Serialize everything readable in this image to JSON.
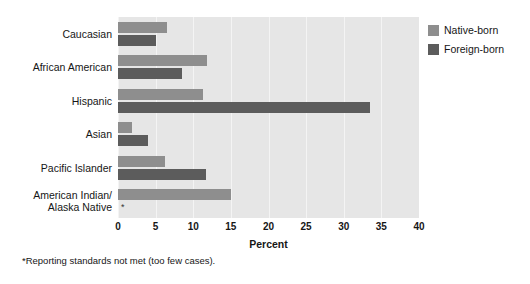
{
  "chart_data": {
    "type": "bar",
    "orientation": "horizontal",
    "title": "",
    "xlabel": "Percent",
    "ylabel": "",
    "xlim": [
      0,
      40
    ],
    "xticks": [
      0,
      5,
      10,
      15,
      20,
      25,
      30,
      35,
      40
    ],
    "grid": true,
    "legend_position": "top-right",
    "categories": [
      "Caucasian",
      "African American",
      "Hispanic",
      "Asian",
      "Pacific Islander",
      "American Indian/\nAlaska Native"
    ],
    "series": [
      {
        "name": "Native-born",
        "color": "#8e8e8e",
        "values": [
          6.5,
          11.8,
          11.3,
          1.8,
          6.3,
          15.0
        ]
      },
      {
        "name": "Foreign-born",
        "color": "#5c5c5c",
        "values": [
          5.0,
          8.5,
          33.5,
          4.0,
          11.7,
          null
        ]
      }
    ],
    "annotations": [
      {
        "text": "*",
        "category": "American Indian/\nAlaska Native",
        "series": "Foreign-born",
        "meaning": "Reporting standards not met (too few cases)."
      }
    ],
    "footnote": "*Reporting standards not met (too few cases)."
  },
  "legend": {
    "items": [
      {
        "label": "Native-born",
        "color": "#8e8e8e"
      },
      {
        "label": "Foreign-born",
        "color": "#5c5c5c"
      }
    ]
  },
  "axis": {
    "x_title": "Percent",
    "x_tick_labels": [
      "0",
      "5",
      "10",
      "15",
      "20",
      "25",
      "30",
      "35",
      "40"
    ]
  },
  "footnote": "*Reporting standards not met (too few cases).",
  "suppressed_marker": "*"
}
